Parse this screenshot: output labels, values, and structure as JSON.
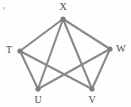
{
  "figure": {
    "background_color": "#fefefe",
    "edge_color": "#8a8a8a",
    "node_color": "#7d7d7d",
    "label_color": "#4d4d4d",
    "edge_width": 2.1,
    "node_radius": 2.6,
    "width": 131,
    "height": 107
  },
  "chart_data": {
    "type": "diagram",
    "subtype": "node-link-graph",
    "directed": false,
    "node_count": 5,
    "edge_count": 8,
    "nodes": [
      {
        "id": "X",
        "label": "X",
        "x": 63,
        "y": 19,
        "label_x": 63,
        "label_y": 7,
        "degree": 4
      },
      {
        "id": "T",
        "label": "T",
        "x": 20,
        "y": 51,
        "label_x": 9,
        "label_y": 50,
        "degree": 3
      },
      {
        "id": "W",
        "label": "W",
        "x": 110,
        "y": 49,
        "label_x": 121,
        "label_y": 49,
        "degree": 3
      },
      {
        "id": "U",
        "label": "U",
        "x": 38,
        "y": 89,
        "label_x": 38,
        "label_y": 100,
        "degree": 3
      },
      {
        "id": "V",
        "label": "V",
        "x": 92,
        "y": 89,
        "label_x": 92,
        "label_y": 100,
        "degree": 3
      }
    ],
    "edges": [
      {
        "source": "T",
        "target": "X"
      },
      {
        "source": "X",
        "target": "W"
      },
      {
        "source": "T",
        "target": "U"
      },
      {
        "source": "T",
        "target": "V"
      },
      {
        "source": "X",
        "target": "U"
      },
      {
        "source": "X",
        "target": "V"
      },
      {
        "source": "W",
        "target": "U"
      },
      {
        "source": "W",
        "target": "V"
      }
    ],
    "missing_edges": [
      {
        "source": "T",
        "target": "W"
      },
      {
        "source": "U",
        "target": "V"
      }
    ]
  }
}
